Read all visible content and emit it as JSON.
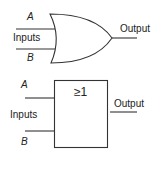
{
  "diagrams": [
    {
      "name": "or-gate-distinctive-shape",
      "labels": {
        "input_a": "A",
        "input_b": "B",
        "inputs": "Inputs",
        "output": "Output"
      }
    },
    {
      "name": "or-gate-iec-rectangular",
      "labels": {
        "input_a": "A",
        "input_b": "B",
        "inputs": "Inputs",
        "output": "Output",
        "symbol": "≥1"
      }
    }
  ]
}
